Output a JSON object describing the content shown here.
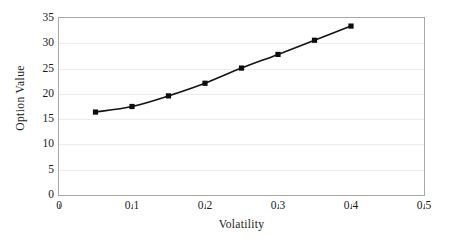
{
  "chart_data": {
    "type": "line",
    "title": "",
    "xlabel": "Volatility",
    "ylabel": "Option Value",
    "xlim": [
      0,
      0.5
    ],
    "ylim": [
      0,
      35
    ],
    "xticks": [
      "0",
      "0.1",
      "0.2",
      "0.3",
      "0.4",
      "0.5"
    ],
    "xtick_values": [
      0,
      0.1,
      0.2,
      0.3,
      0.4,
      0.5
    ],
    "yticks": [
      "0",
      "5",
      "10",
      "15",
      "20",
      "25",
      "30",
      "35"
    ],
    "ytick_values": [
      0,
      5,
      10,
      15,
      20,
      25,
      30,
      35
    ],
    "grid": "horizontal",
    "legend": "none",
    "marker": "square",
    "line_color": "#141414",
    "marker_color": "#0d0d0d",
    "gridline_color": "#ececec",
    "frame_color": "#a8a8a8",
    "x": [
      0.05,
      0.1,
      0.15,
      0.2,
      0.25,
      0.3,
      0.35,
      0.4
    ],
    "values": [
      16.4,
      17.5,
      19.6,
      22.1,
      25.1,
      27.8,
      30.6,
      33.4
    ],
    "series": [
      {
        "name": "Option Value",
        "values": [
          16.4,
          17.5,
          19.6,
          22.1,
          25.1,
          27.8,
          30.6,
          33.4
        ]
      }
    ]
  }
}
